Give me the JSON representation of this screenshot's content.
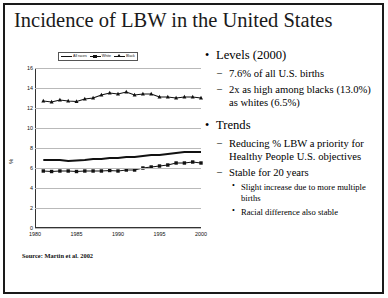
{
  "slide": {
    "title": "Incidence of LBW in the United States",
    "source": "Source: Martin et al. 2002"
  },
  "bullets": {
    "levels_heading": "Levels (2000)",
    "levels_1": "7.6% of all U.S. births",
    "levels_2": "2x as high among blacks (13.0%) as whites (6.5%)",
    "trends_heading": "Trends",
    "trends_1": "Reducing % LBW a priority for Healthy People U.S. objectives",
    "trends_2": "Stable for 20 years",
    "trends_2a": "Slight increase due to more multiple births",
    "trends_2b": "Racial difference also stable",
    "bullet_glyph_l1": "•",
    "bullet_glyph_l2": "–",
    "bullet_glyph_l3": "•"
  },
  "chart_data": {
    "type": "line",
    "title": "",
    "xlabel": "",
    "ylabel": "%",
    "xlim": [
      1980,
      2000
    ],
    "ylim": [
      0,
      16
    ],
    "ytick_values": [
      16,
      14,
      12,
      10,
      8,
      6,
      4,
      2,
      0
    ],
    "xtick_values": [
      1980,
      1985,
      1990,
      1995,
      2000
    ],
    "grid": true,
    "legend_position": "top-center",
    "x": [
      1981,
      1982,
      1983,
      1984,
      1985,
      1986,
      1987,
      1988,
      1989,
      1990,
      1991,
      1992,
      1993,
      1994,
      1995,
      1996,
      1997,
      1998,
      1999,
      2000
    ],
    "series": [
      {
        "name": "All races",
        "marker": "none",
        "values": [
          6.8,
          6.8,
          6.8,
          6.7,
          6.75,
          6.8,
          6.9,
          6.9,
          7.0,
          7.0,
          7.1,
          7.1,
          7.2,
          7.3,
          7.3,
          7.4,
          7.5,
          7.6,
          7.6,
          7.6
        ]
      },
      {
        "name": "White",
        "marker": "square",
        "values": [
          5.7,
          5.65,
          5.7,
          5.7,
          5.65,
          5.7,
          5.7,
          5.7,
          5.75,
          5.7,
          5.8,
          5.8,
          6.0,
          6.1,
          6.2,
          6.3,
          6.5,
          6.5,
          6.6,
          6.5
        ]
      },
      {
        "name": "Black",
        "marker": "triangle",
        "values": [
          12.7,
          12.6,
          12.8,
          12.7,
          12.65,
          12.9,
          13.0,
          13.3,
          13.5,
          13.4,
          13.6,
          13.3,
          13.4,
          13.4,
          13.1,
          13.1,
          13.0,
          13.1,
          13.1,
          13.0
        ]
      }
    ]
  }
}
